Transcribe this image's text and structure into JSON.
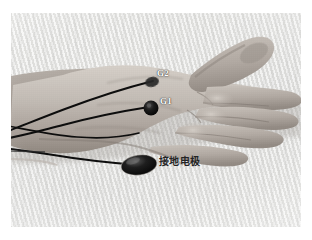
{
  "figure": {
    "kind": "photograph",
    "view": "dorsal hand, fingers pointing right, forearm at left",
    "color_mode": "grayscale",
    "plate": {
      "left": 11,
      "top": 13,
      "width": 290,
      "height": 214
    },
    "page_background": "#ffffff",
    "photo_background": "#ebebe9"
  },
  "annotations": [
    {
      "id": "g2",
      "label": "G2",
      "role": "reference-electrode-label",
      "text_color": "#fdfdfd",
      "marker": "small dark electrode disc over first dorsal interosseous / thumb web",
      "marker_color": "#2b2b2b",
      "x": 146,
      "y": 56
    },
    {
      "id": "g1",
      "label": "G1",
      "role": "active-electrode-label",
      "text_color": "#fdfdfd",
      "marker": "round black electrode disc on dorsum of hand",
      "marker_color": "#141414",
      "x": 149,
      "y": 84
    },
    {
      "id": "ground",
      "label": "接地电极",
      "label_translation": "ground electrode",
      "role": "ground-electrode-label",
      "text_color": "#242424",
      "marker": "large dark elliptical ground electrode pad on palm edge",
      "marker_color": "#1a1a1a",
      "x": 148,
      "y": 144
    }
  ],
  "leads": {
    "count": 3,
    "color": "#111111",
    "description": "three thin black electrode lead wires running leftward across the forearm and off the left edge of the photo"
  },
  "colors": {
    "skin_light": "#cfc9c2",
    "skin_mid": "#b3aca5",
    "skin_shadow": "#8e8881",
    "electrode_black": "#141414",
    "label_white": "#fdfdfd",
    "label_dark": "#242424",
    "page_white": "#ffffff"
  }
}
